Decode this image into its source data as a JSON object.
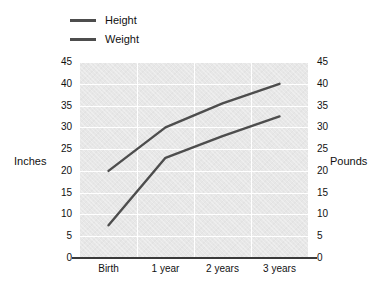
{
  "chart_data": {
    "type": "line",
    "title": "",
    "subtitle": "",
    "xlabel": "",
    "ylabel": "Inches",
    "y2label": "Pounds",
    "categories": [
      "Birth",
      "1 year",
      "2 years",
      "3 years"
    ],
    "series": [
      {
        "name": "Height",
        "axis": "left",
        "unit": "inches",
        "values": [
          20,
          30,
          35.5,
          40
        ],
        "color": "#4d4d4d"
      },
      {
        "name": "Weight",
        "axis": "right",
        "unit": "pounds",
        "values": [
          7.5,
          23,
          28,
          32.5
        ],
        "color": "#4d4d4d"
      }
    ],
    "ylim": [
      0,
      45
    ],
    "y2lim": [
      0,
      45
    ],
    "yticks": [
      45,
      40,
      35,
      30,
      25,
      20,
      15,
      10,
      5,
      0
    ],
    "y2ticks": [
      45,
      40,
      35,
      30,
      25,
      20,
      15,
      10,
      5,
      0
    ],
    "grid": true,
    "legend_position": "top-left",
    "plot_background": "#e7e7e7",
    "gridline_color": "#ffffff",
    "axis_color": "#3a3a3a"
  },
  "legend": {
    "items": [
      {
        "label": "Height"
      },
      {
        "label": "Weight"
      }
    ]
  },
  "axes": {
    "left_title": "Inches",
    "right_title": "Pounds"
  }
}
